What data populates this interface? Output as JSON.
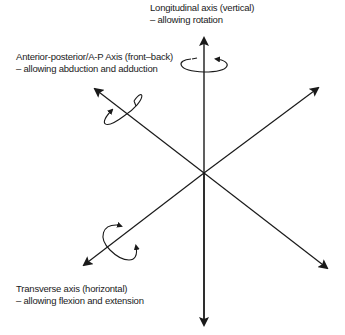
{
  "diagram": {
    "colors": {
      "line": "#1a1a1a",
      "background": "#ffffff"
    },
    "axes": [
      {
        "id": "longitudinal",
        "name": "Longitudinal axis (vertical)",
        "movement": "– allowing rotation",
        "icon": "rotation-arrow-icon"
      },
      {
        "id": "anterior-posterior",
        "name": "Anterior-posterior/A-P Axis (front–back)",
        "movement": "– allowing abduction and adduction",
        "icon": "rotation-arrow-icon"
      },
      {
        "id": "transverse",
        "name": "Transverse axis (horizontal)",
        "movement": "– allowing flexion and extension",
        "icon": "rotation-arrow-icon"
      }
    ]
  }
}
